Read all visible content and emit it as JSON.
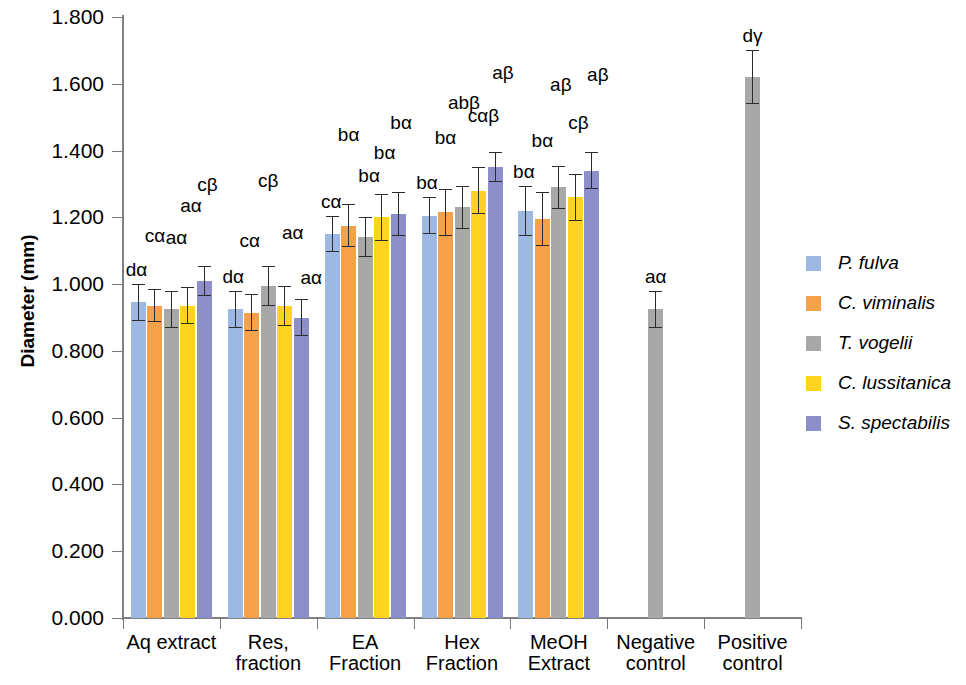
{
  "chart_data": {
    "type": "bar",
    "title": "",
    "xlabel": "",
    "ylabel": "Diameter (mm)",
    "ylim": [
      0.0,
      1.8
    ],
    "ytick_step": 0.2,
    "ytick_labels": [
      "1.800",
      "1.600",
      "1.400",
      "1.200",
      "1.000",
      "0.800",
      "0.600",
      "0.400",
      "0.200",
      "0.000"
    ],
    "ytick_values": [
      1.8,
      1.6,
      1.4,
      1.2,
      1.0,
      0.8,
      0.6,
      0.4,
      0.2,
      0.0
    ],
    "grid": false,
    "legend_position": "right",
    "categories": [
      "Aq extract",
      "Res,\nfraction",
      "EA\nFraction",
      "Hex\nFraction",
      "MeOH\nExtract",
      "Negative\ncontrol",
      "Positive\ncontrol"
    ],
    "series": [
      {
        "name": "P. fulva",
        "color": "#9DB9E3",
        "values": [
          0.945,
          0.925,
          1.15,
          1.205,
          1.22,
          null,
          null
        ],
        "errors": [
          0.055,
          0.055,
          0.055,
          0.055,
          0.075,
          null,
          null
        ],
        "labels": [
          "dα",
          "dα",
          "cα",
          "bα",
          "bα",
          null,
          null
        ]
      },
      {
        "name": "C. viminalis",
        "color": "#F4A14A",
        "values": [
          0.935,
          0.915,
          1.175,
          1.215,
          1.195,
          null,
          null
        ],
        "errors": [
          0.05,
          0.055,
          0.065,
          0.07,
          0.08,
          null,
          null
        ],
        "labels": [
          "cα",
          "cα",
          "bα",
          "bα",
          "bα",
          null,
          null
        ]
      },
      {
        "name": "T. vogelii",
        "color": "#A8A8A8",
        "values": [
          0.925,
          0.995,
          1.14,
          1.23,
          1.29,
          0.925,
          1.62
        ],
        "errors": [
          0.055,
          0.06,
          0.06,
          0.065,
          0.065,
          0.055,
          0.08
        ],
        "labels": [
          "aα",
          "cβ",
          "bα",
          "abβ",
          "aβ",
          "aα",
          "dγ"
        ]
      },
      {
        "name": "C. lussitanica",
        "color": "#FFD320",
        "values": [
          0.935,
          0.935,
          1.2,
          1.28,
          1.26,
          null,
          null
        ],
        "errors": [
          0.055,
          0.06,
          0.07,
          0.07,
          0.07,
          null,
          null
        ],
        "labels": [
          "aα",
          "aα",
          "bα",
          "cαβ",
          "cβ",
          null,
          null
        ]
      },
      {
        "name": "S. spectabilis",
        "color": "#8D8FCB",
        "values": [
          1.01,
          0.9,
          1.21,
          1.35,
          1.34,
          null,
          null
        ],
        "errors": [
          0.045,
          0.055,
          0.065,
          0.045,
          0.055,
          null,
          null
        ],
        "labels": [
          "cβ",
          "aα",
          "bα",
          "aβ",
          "aβ",
          null,
          null
        ]
      }
    ]
  },
  "legend": {
    "items": [
      {
        "label": "P. fulva",
        "color": "#9DB9E3"
      },
      {
        "label": "C. viminalis",
        "color": "#F4A14A"
      },
      {
        "label": "T. vogelii",
        "color": "#A8A8A8"
      },
      {
        "label": "C. lussitanica",
        "color": "#FFD320"
      },
      {
        "label": "S. spectabilis",
        "color": "#8D8FCB"
      }
    ]
  }
}
